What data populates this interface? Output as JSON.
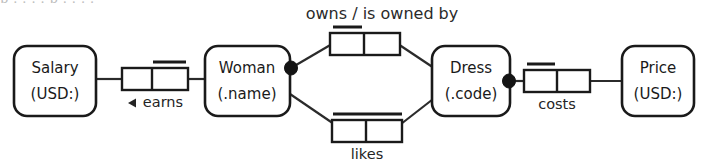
{
  "diagram": {
    "type": "orm-fact-type-diagram",
    "title_fragment_clipped": "p . . . . p . . . .",
    "colors": {
      "stroke": "#1a1a1a",
      "fill": "#ffffff",
      "text": "#1a1a1a",
      "connector": "#2b2b2b",
      "mandatory_dot": "#141414"
    },
    "entities": [
      {
        "id": "salary",
        "name": "Salary",
        "reference_mode": "(USD:)",
        "x": 14,
        "y": 46,
        "w": 82,
        "h": 70
      },
      {
        "id": "woman",
        "name": "Woman",
        "reference_mode": "(.name)",
        "x": 205,
        "y": 46,
        "w": 85,
        "h": 70
      },
      {
        "id": "dress",
        "name": "Dress",
        "reference_mode": "(.code)",
        "x": 432,
        "y": 46,
        "w": 78,
        "h": 70
      },
      {
        "id": "price",
        "name": "Price",
        "reference_mode": "(USD:)",
        "x": 622,
        "y": 46,
        "w": 72,
        "h": 70
      }
    ],
    "fact_types": [
      {
        "id": "earns",
        "label": "earns",
        "reading_direction": "left",
        "arrow": "◀",
        "roles": 2,
        "uniqueness_span": "right",
        "x": 122,
        "y": 68,
        "w": 66,
        "h": 22
      },
      {
        "id": "owns",
        "label": "owns  /  is owned by",
        "label_position": "above",
        "roles": 2,
        "uniqueness_span": "left",
        "x": 330,
        "y": 30,
        "w": 70,
        "h": 22
      },
      {
        "id": "likes",
        "label": "likes",
        "label_position": "below",
        "roles": 2,
        "uniqueness_span": "both",
        "x": 332,
        "y": 120,
        "w": 70,
        "h": 22
      },
      {
        "id": "costs",
        "label": "costs",
        "label_position": "below",
        "roles": 2,
        "uniqueness_span": "left",
        "x": 524,
        "y": 68,
        "w": 66,
        "h": 22
      }
    ],
    "mandatory_roles": [
      {
        "id": "woman-mandatory",
        "on_entity": "woman",
        "cx": 291,
        "cy": 68
      },
      {
        "id": "dress-mandatory",
        "on_entity": "dress",
        "cx": 509,
        "cy": 82
      }
    ]
  }
}
